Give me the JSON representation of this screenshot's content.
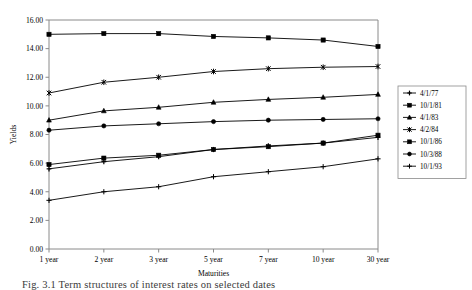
{
  "chart_data": {
    "type": "line",
    "title": "",
    "xlabel": "Maturities",
    "ylabel": "Yields",
    "categories": [
      "1 year",
      "2 year",
      "3 year",
      "5 year",
      "7 year",
      "10 year",
      "30 year"
    ],
    "ylim": [
      0.0,
      16.0
    ],
    "ytick_step": 2.0,
    "ytick_labels": [
      "0.00",
      "2.00",
      "4.00",
      "6.00",
      "8.00",
      "10.00",
      "12.00",
      "14.00",
      "16.00"
    ],
    "grid": false,
    "legend_position": "right",
    "series": [
      {
        "name": "4/1/77",
        "marker": "plus-bar",
        "color": "#000000",
        "values": [
          5.6,
          6.1,
          6.45,
          6.95,
          7.2,
          7.4,
          7.8
        ]
      },
      {
        "name": "10/1/81",
        "marker": "square",
        "color": "#000000",
        "values": [
          15.0,
          15.05,
          15.05,
          14.85,
          14.75,
          14.6,
          14.15
        ]
      },
      {
        "name": "4/1/83",
        "marker": "triangle",
        "color": "#000000",
        "values": [
          9.0,
          9.65,
          9.9,
          10.25,
          10.45,
          10.6,
          10.8
        ]
      },
      {
        "name": "4/2/84",
        "marker": "x-bar",
        "color": "#000000",
        "values": [
          10.9,
          11.65,
          12.0,
          12.4,
          12.6,
          12.7,
          12.75
        ]
      },
      {
        "name": "10/1/86",
        "marker": "square",
        "color": "#000000",
        "values": [
          5.9,
          6.35,
          6.55,
          6.95,
          7.15,
          7.4,
          7.95
        ]
      },
      {
        "name": "10/3/88",
        "marker": "circle",
        "color": "#000000",
        "values": [
          8.3,
          8.6,
          8.75,
          8.9,
          9.0,
          9.05,
          9.1
        ]
      },
      {
        "name": "10/1/93",
        "marker": "plus",
        "color": "#000000",
        "values": [
          3.4,
          4.0,
          4.35,
          5.05,
          5.4,
          5.75,
          6.3
        ]
      }
    ]
  },
  "axes": {
    "y_title": "Yields",
    "x_title": "Maturities"
  },
  "caption": {
    "text": "Fig. 3.1   Term structures of interest rates on selected dates"
  }
}
